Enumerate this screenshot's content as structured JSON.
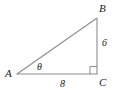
{
  "figure": {
    "kind": "right-triangle-diagram",
    "background_color": "#ffffff",
    "stroke_color": "#8c8c8c",
    "text_color": "#1a1a1a",
    "vertices": {
      "A": {
        "label": "A",
        "x": 17,
        "y": 74
      },
      "B": {
        "label": "B",
        "x": 97,
        "y": 18
      },
      "C": {
        "label": "C",
        "x": 97,
        "y": 74
      }
    },
    "sides": [
      {
        "name": "AC",
        "label": "8",
        "from": "A",
        "to": "C"
      },
      {
        "name": "BC",
        "label": "6",
        "from": "B",
        "to": "C"
      },
      {
        "name": "AB",
        "label": "",
        "from": "A",
        "to": "B"
      }
    ],
    "angles": [
      {
        "at": "A",
        "label": "θ"
      },
      {
        "at": "C",
        "label": "",
        "marker": "right-angle-square"
      }
    ]
  }
}
